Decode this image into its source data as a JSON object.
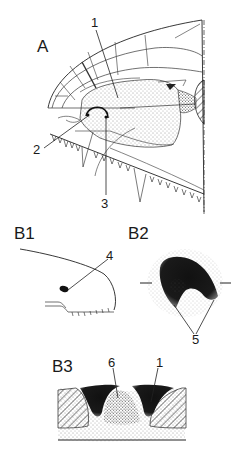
{
  "figure": {
    "panels": [
      {
        "id": "A",
        "label": "A",
        "callouts": [
          "1",
          "2",
          "3"
        ]
      },
      {
        "id": "B1",
        "label": "B1",
        "callouts": [
          "4"
        ]
      },
      {
        "id": "B2",
        "label": "B2",
        "callouts": [
          "5"
        ]
      },
      {
        "id": "B3",
        "label": "B3",
        "callouts": [
          "6",
          "1"
        ]
      }
    ],
    "callouts": {
      "a1": "1",
      "a2": "2",
      "a3": "3",
      "b1_4": "4",
      "b2_5": "5",
      "b3_6": "6",
      "b3_1": "1"
    }
  },
  "colors": {
    "ink": "#1a1a1a",
    "background": "#ffffff"
  }
}
